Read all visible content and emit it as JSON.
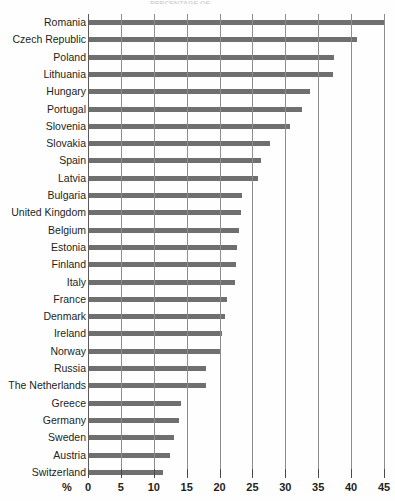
{
  "title_partial": "PERCENTAGE OF",
  "axis": {
    "x_unit_label": "%",
    "x_ticks": [
      0,
      5,
      10,
      15,
      20,
      25,
      30,
      35,
      40,
      45
    ],
    "x_min": 0,
    "x_max": 45
  },
  "colors": {
    "bar": "#6f6f6f",
    "gridline": "#8d8d8d",
    "text": "#231f20",
    "background": "#fefefe"
  },
  "chart_data": {
    "type": "bar",
    "orientation": "horizontal",
    "title": "PERCENTAGE OF",
    "xlabel": "%",
    "ylabel": "",
    "xlim": [
      0,
      45
    ],
    "grid": true,
    "legend": null,
    "categories": [
      "Romania",
      "Czech Republic",
      "Poland",
      "Lithuania",
      "Hungary",
      "Portugal",
      "Slovenia",
      "Slovakia",
      "Spain",
      "Latvia",
      "Bulgaria",
      "United Kingdom",
      "Belgium",
      "Estonia",
      "Finland",
      "Italy",
      "France",
      "Denmark",
      "Ireland",
      "Norway",
      "Russia",
      "The Netherlands",
      "Greece",
      "Germany",
      "Sweden",
      "Austria",
      "Switzerland"
    ],
    "values": [
      45.0,
      40.9,
      37.4,
      37.2,
      33.8,
      32.5,
      30.7,
      27.7,
      26.3,
      25.8,
      23.4,
      23.3,
      22.9,
      22.7,
      22.5,
      22.3,
      21.1,
      20.8,
      20.4,
      20.0,
      18.0,
      18.0,
      14.1,
      13.9,
      13.1,
      12.5,
      11.4
    ]
  }
}
